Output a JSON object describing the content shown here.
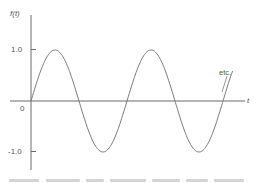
{
  "chart_data": {
    "type": "line",
    "title": "",
    "xlabel": "t",
    "ylabel": "f(t)",
    "ylim": [
      -1.0,
      1.0
    ],
    "y_ticks": [
      {
        "value": 1.0,
        "label": "1.0"
      },
      {
        "value": 0,
        "label": "0"
      },
      {
        "value": -1.0,
        "label": "-1.0"
      }
    ],
    "x_ticks": [],
    "grid": false,
    "legend": null,
    "series": [
      {
        "name": "f(t) = sin(t)",
        "function": "sine",
        "amplitude": 1.0,
        "periods_shown": 2.1,
        "x": [
          0,
          0.25,
          0.5,
          0.75,
          1.0,
          1.25,
          1.5,
          1.75,
          2.0,
          2.1
        ],
        "values": [
          0,
          1.0,
          0,
          -1.0,
          0,
          1.0,
          0,
          -1.0,
          0,
          0.59
        ]
      }
    ],
    "annotations": [
      {
        "text": "etc.",
        "points_to": "curve continuation at right end"
      }
    ]
  },
  "labels": {
    "y_axis": "f(t)",
    "x_axis": "t",
    "tick_pos": "1.0",
    "tick_zero": "0",
    "tick_neg": "-1.0",
    "annotation": "etc."
  },
  "style": {
    "axis_color": "#6b6b6b",
    "curve_color": "#7a7a7a",
    "text_color": "#555555"
  }
}
